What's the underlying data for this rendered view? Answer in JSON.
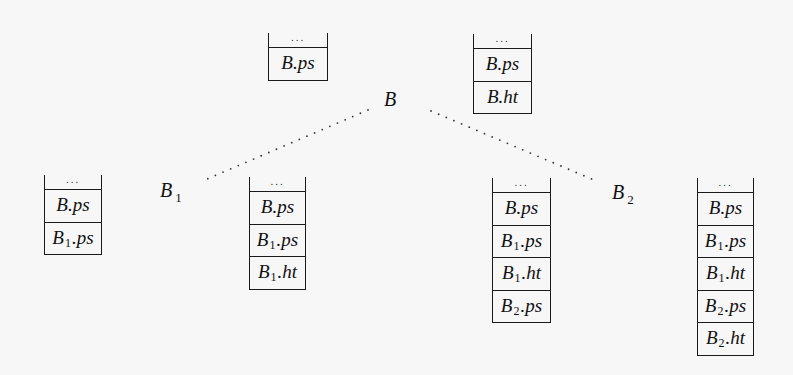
{
  "diagram": {
    "type": "tree-with-stacks",
    "nodes": {
      "root": {
        "label": "B",
        "sub": ""
      },
      "left": {
        "label": "B",
        "sub": "1"
      },
      "right": {
        "label": "B",
        "sub": "2"
      }
    },
    "edges": [
      {
        "from": "B",
        "to": "B1",
        "style": "dotted"
      },
      {
        "from": "B",
        "to": "B2",
        "style": "dotted"
      }
    ],
    "stacks": [
      {
        "id": "root-entry",
        "top_label": "...",
        "cells": [
          {
            "base": "B",
            "sub": "",
            "field": ".ps"
          }
        ]
      },
      {
        "id": "root-exit",
        "top_label": "...",
        "cells": [
          {
            "base": "B",
            "sub": "",
            "field": ".ps"
          },
          {
            "base": "B",
            "sub": "",
            "field": ".ht"
          }
        ]
      },
      {
        "id": "b1-entry",
        "top_label": "...",
        "cells": [
          {
            "base": "B",
            "sub": "",
            "field": ".ps"
          },
          {
            "base": "B",
            "sub": "1",
            "field": ".ps"
          }
        ]
      },
      {
        "id": "b1-exit",
        "top_label": "...",
        "cells": [
          {
            "base": "B",
            "sub": "",
            "field": ".ps"
          },
          {
            "base": "B",
            "sub": "1",
            "field": ".ps"
          },
          {
            "base": "B",
            "sub": "1",
            "field": ".ht"
          }
        ]
      },
      {
        "id": "b2-entry",
        "top_label": "...",
        "cells": [
          {
            "base": "B",
            "sub": "",
            "field": ".ps"
          },
          {
            "base": "B",
            "sub": "1",
            "field": ".ps"
          },
          {
            "base": "B",
            "sub": "1",
            "field": ".ht"
          },
          {
            "base": "B",
            "sub": "2",
            "field": ".ps"
          }
        ]
      },
      {
        "id": "b2-exit",
        "top_label": "...",
        "cells": [
          {
            "base": "B",
            "sub": "",
            "field": ".ps"
          },
          {
            "base": "B",
            "sub": "1",
            "field": ".ps"
          },
          {
            "base": "B",
            "sub": "1",
            "field": ".ht"
          },
          {
            "base": "B",
            "sub": "2",
            "field": ".ps"
          },
          {
            "base": "B",
            "sub": "2",
            "field": ".ht"
          }
        ]
      }
    ]
  }
}
